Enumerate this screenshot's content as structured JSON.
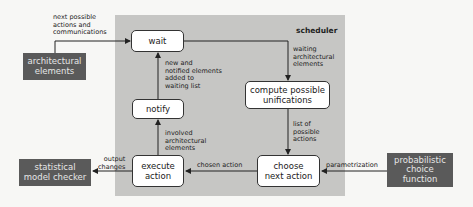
{
  "scheduler": {
    "title": "scheduler",
    "nodes": {
      "wait": "wait",
      "compute": "compute possible\nunifications",
      "notify": "notify",
      "execute": "execute\naction",
      "choose": "choose\nnext action"
    },
    "edge_labels": {
      "wait_to_compute": "waiting\narchitectural\nelements",
      "compute_to_choose": "list of\npossible\nactions",
      "choose_to_execute": "chosen action",
      "execute_to_notify": "involved\narchitectural\nelements",
      "notify_to_wait": "new and\nnotified elements\nadded to\nwaiting list"
    }
  },
  "external": {
    "architectural_elements": "architectural\nelements",
    "statistical_model_checker": "statistical\nmodel checker",
    "probabilistic_choice_function": "probabilistic\nchoice\nfunction"
  },
  "external_edge_labels": {
    "arch_to_wait": "next possible\nactions and\ncommunications",
    "execute_to_checker": "output\nchanges",
    "function_to_choose": "parametrization"
  },
  "colors": {
    "panel": "#c6c6c4",
    "external_box": "#5a5a5a",
    "node_fill": "#ffffff",
    "line": "#222222"
  }
}
